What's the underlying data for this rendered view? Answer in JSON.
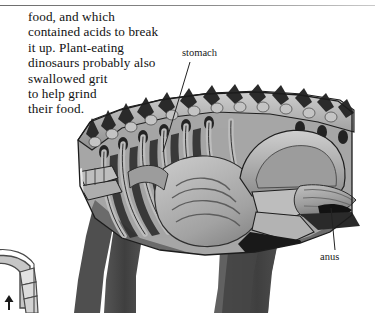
{
  "page": {
    "background_color": "#ffffff",
    "rule_color": "#6d6d6d"
  },
  "body": {
    "paragraph": "food, and which\ncontained acids to break\nit up. Plant-eating\ndinosaurs probably also\nswallowed grit\nto help grind\ntheir food."
  },
  "labels": {
    "stomach": "stomach",
    "anus": "anus"
  },
  "illustration": {
    "subject": "dinosaur-anatomical-cutaway",
    "description": "Cutaway side view of a plant-eating dinosaur's torso showing vertebrae, ribcage, stomach and intestines, pelvis and hind leg",
    "palette": {
      "bone_light": "#b9b9b9",
      "bone_mid": "#9a9a9a",
      "flesh_dark": "#3a3a3a",
      "leg_gray": "#4a4a4a",
      "outline": "#1e1e1e",
      "organ_gray": "#8e8e8e",
      "highlight": "#d4d4d4"
    }
  },
  "inset": {
    "subject": "limb-detail-sketch",
    "description": "Partial line-art sketch of a leg at the lower-left corner of the page",
    "marker": "up-arrow",
    "line_color": "#4a4a4a",
    "fill_color": "#c6c6c6"
  }
}
